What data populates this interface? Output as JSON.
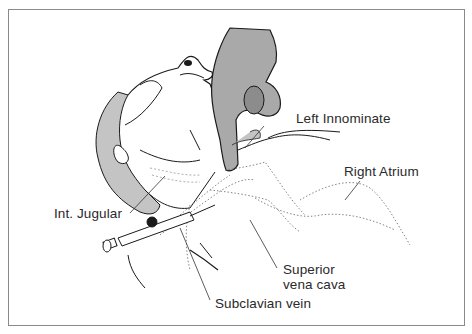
{
  "figure": {
    "labels": {
      "left_innominate": "Left Innominate",
      "right_atrium": "Right Atrium",
      "int_jugular": "Int. Jugular",
      "superior_vena_cava_line1": "Superior",
      "superior_vena_cava_line2": "vena cava",
      "subclavian_vein": "Subclavian vein"
    },
    "colors": {
      "line": "#1a1a1a",
      "hair_shade": "#c4c4c4",
      "hand_shade": "#a9a9a9",
      "border": "#8a8a8a",
      "dotted_vessel": "#777777"
    }
  }
}
